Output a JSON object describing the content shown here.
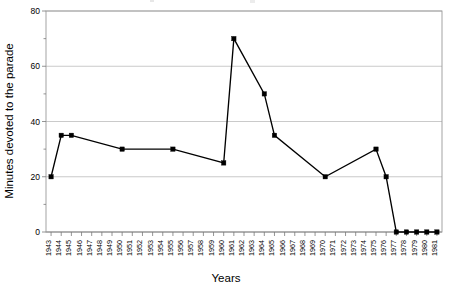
{
  "chart_data": {
    "type": "line",
    "title": "",
    "xlabel": "Years",
    "ylabel": "Minutes devoted to the parade",
    "ylim": [
      0,
      80
    ],
    "ytick_labels": [
      "0",
      "20",
      "40",
      "60",
      "80"
    ],
    "ytick_values": [
      0,
      20,
      40,
      60,
      80
    ],
    "y_minor_interval": 10,
    "grid": true,
    "grid_axis": "y",
    "legend": false,
    "legend_position": "none",
    "marker": "square",
    "line_color": "#000000",
    "marker_color": "#000000",
    "gridline_color": "#b3b3b3",
    "background_color": "#ffffff",
    "categories": [
      "1943",
      "1944",
      "1945",
      "1946",
      "1947",
      "1948",
      "1949",
      "1950",
      "1951",
      "1952",
      "1953",
      "1954",
      "1955",
      "1956",
      "1957",
      "1958",
      "1959",
      "1960",
      "1961",
      "1962",
      "1963",
      "1964",
      "1965",
      "1966",
      "1967",
      "1968",
      "1969",
      "1970",
      "1971",
      "1972",
      "1973",
      "1974",
      "1975",
      "1976",
      "1977",
      "1978",
      "1979",
      "1980",
      "1981"
    ],
    "points": [
      {
        "x": "1943",
        "y": 20
      },
      {
        "x": "1944",
        "y": 35
      },
      {
        "x": "1945",
        "y": 35
      },
      {
        "x": "1950",
        "y": 30
      },
      {
        "x": "1955",
        "y": 30
      },
      {
        "x": "1960",
        "y": 25
      },
      {
        "x": "1961",
        "y": 70
      },
      {
        "x": "1964",
        "y": 50
      },
      {
        "x": "1965",
        "y": 35
      },
      {
        "x": "1970",
        "y": 20
      },
      {
        "x": "1975",
        "y": 30
      },
      {
        "x": "1976",
        "y": 20
      },
      {
        "x": "1977",
        "y": 0
      },
      {
        "x": "1978",
        "y": 0
      },
      {
        "x": "1979",
        "y": 0
      },
      {
        "x": "1980",
        "y": 0
      },
      {
        "x": "1981",
        "y": 0
      }
    ],
    "values": [
      20,
      35,
      35,
      null,
      null,
      null,
      null,
      30,
      null,
      null,
      null,
      null,
      30,
      null,
      null,
      null,
      null,
      25,
      70,
      null,
      null,
      50,
      35,
      null,
      null,
      null,
      null,
      20,
      null,
      null,
      null,
      null,
      30,
      20,
      0,
      0,
      0,
      0,
      0
    ]
  }
}
